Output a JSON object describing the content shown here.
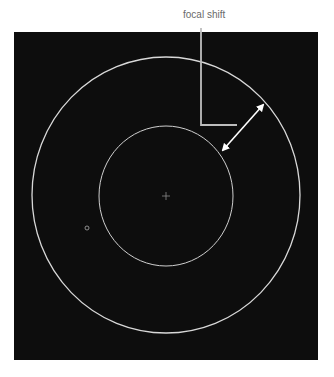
{
  "figure": {
    "callout_label": "focal shift",
    "background_color": "#ffffff",
    "panel_color": "#0d0d0d",
    "line_color": "#d8d8d8",
    "callout_line_color": "#bdbdbd",
    "arrow_color": "#ffffff",
    "label_color": "#6a6a6a"
  },
  "elements": {
    "outer_circle": {
      "cx": 166,
      "cy": 195,
      "rx": 134,
      "ry": 138
    },
    "inner_circle": {
      "cx": 166,
      "cy": 196,
      "rx": 67,
      "ry": 70
    },
    "center_crosshair": {
      "cx": 166,
      "cy": 196
    },
    "small_ring": {
      "cx": 87,
      "cy": 228,
      "r": 2
    },
    "double_arrow": {
      "x1": 223,
      "y1": 150,
      "x2": 263,
      "y2": 105
    }
  }
}
